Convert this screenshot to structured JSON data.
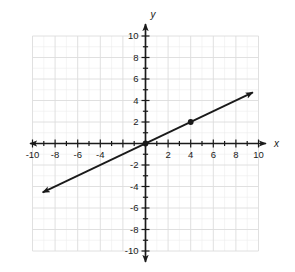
{
  "chart_data": {
    "type": "line",
    "title": "",
    "subtitle": "",
    "xlabel": "x",
    "ylabel": "y",
    "xlim": [
      -10,
      10
    ],
    "ylim": [
      -10,
      10
    ],
    "grid": true,
    "minor_grid": true,
    "legend": "none",
    "x_tick_labels": [
      "-10",
      "-8",
      "-6",
      "-4",
      "2",
      "4",
      "6",
      "8",
      "10"
    ],
    "x_tick_values": [
      -10,
      -8,
      -6,
      -4,
      2,
      4,
      6,
      8,
      10
    ],
    "y_tick_labels": [
      "10",
      "8",
      "6",
      "4",
      "2",
      "-2",
      "-4",
      "-6",
      "-8",
      "-10"
    ],
    "y_tick_values": [
      10,
      8,
      6,
      4,
      2,
      -2,
      -4,
      -6,
      -8,
      -10
    ],
    "minor_tick_step": 1,
    "major_tick_step": 2,
    "series": [
      {
        "name": "line",
        "equation": "y = 0.5x",
        "slope": 0.5,
        "intercept": 0,
        "x": [
          -9.1,
          9.5
        ],
        "values": [
          -4.55,
          4.75
        ],
        "color": "#1a1a1a",
        "arrow_start": true,
        "arrow_end": true
      }
    ],
    "points": [
      {
        "label": "(4, 2)",
        "x": 4,
        "y": 2,
        "color": "#1a1a1a"
      },
      {
        "label": "(0, 0)",
        "x": 0,
        "y": 0,
        "color": "#1a1a1a"
      }
    ],
    "axis_color": "#1a1a1a",
    "grid_color": "#dcdcdc",
    "minor_grid_color": "#ededed",
    "background": "#ffffff"
  },
  "axes": {
    "x_name": "x",
    "y_name": "y"
  }
}
